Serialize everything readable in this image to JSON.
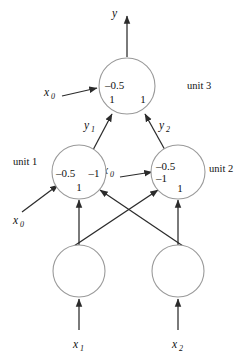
{
  "figure": {
    "type": "neural-network-diagram",
    "background_color": "#ffffff",
    "node_stroke_color": "#9a9a9a",
    "edge_color": "#2b2b2b",
    "text_color": "#111111"
  },
  "output": {
    "label": "y"
  },
  "nodes": {
    "unit3": {
      "name": "unit 3",
      "bias": "–0.5",
      "weight_left": "1",
      "weight_right": "1",
      "bias_input_label": "x",
      "bias_input_sub": "0"
    },
    "unit1": {
      "name": "unit 1",
      "bias": "–0.5",
      "weight_right": "–1",
      "weight_bottom": "1",
      "bias_input_label": "x",
      "bias_input_sub": "0"
    },
    "unit2": {
      "name": "unit 2",
      "bias": "–0.5",
      "weight_second": "–1",
      "weight_bottom": "1",
      "bias_input_label": "x",
      "bias_input_sub": "0"
    },
    "input1": {
      "label": "x",
      "sub": "1"
    },
    "input2": {
      "label": "x",
      "sub": "2"
    }
  },
  "edges": {
    "unit1_to_unit3": {
      "label": "y",
      "sub": "1"
    },
    "unit2_to_unit3": {
      "label": "y",
      "sub": "2"
    }
  }
}
